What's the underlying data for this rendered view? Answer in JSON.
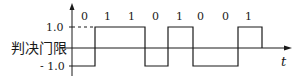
{
  "diagram": {
    "bits": [
      "0",
      "1",
      "1",
      "0",
      "1",
      "0",
      "0",
      "1"
    ],
    "y_high_label": "1.0",
    "y_low_label": "- 1.0",
    "threshold_label": "判决门限",
    "time_axis_label": "t",
    "colors": {
      "stroke": "#1a1a1a",
      "background": "#ffffff"
    }
  }
}
